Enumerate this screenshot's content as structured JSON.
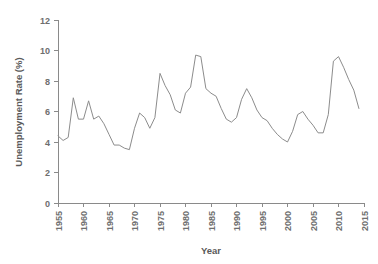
{
  "chart_data": {
    "type": "line",
    "title": "",
    "xlabel": "Year",
    "ylabel": "Unemployment Rate (%)",
    "xlim": [
      1955,
      2015
    ],
    "ylim": [
      0,
      12
    ],
    "xticks": [
      1955,
      1960,
      1965,
      1970,
      1975,
      1980,
      1985,
      1990,
      1995,
      2000,
      2005,
      2010,
      2015
    ],
    "yticks": [
      0,
      2,
      4,
      6,
      8,
      10,
      12
    ],
    "grid": false,
    "legend": "none",
    "line_color": "#8c8c8c",
    "series": [
      {
        "name": "Unemployment Rate",
        "x": [
          1955,
          1956,
          1957,
          1958,
          1959,
          1960,
          1961,
          1962,
          1963,
          1964,
          1965,
          1966,
          1967,
          1968,
          1969,
          1970,
          1971,
          1972,
          1973,
          1974,
          1975,
          1976,
          1977,
          1978,
          1979,
          1980,
          1981,
          1982,
          1983,
          1984,
          1985,
          1986,
          1987,
          1988,
          1989,
          1990,
          1991,
          1992,
          1993,
          1994,
          1995,
          1996,
          1997,
          1998,
          1999,
          2000,
          2001,
          2002,
          2003,
          2004,
          2005,
          2006,
          2007,
          2008,
          2009,
          2010,
          2011,
          2012,
          2013,
          2014
        ],
        "values": [
          4.4,
          4.1,
          4.3,
          6.9,
          5.5,
          5.5,
          6.7,
          5.5,
          5.7,
          5.2,
          4.5,
          3.8,
          3.8,
          3.6,
          3.5,
          4.9,
          5.9,
          5.6,
          4.9,
          5.6,
          8.5,
          7.7,
          7.1,
          6.1,
          5.9,
          7.2,
          7.6,
          9.7,
          9.6,
          7.5,
          7.2,
          7.0,
          6.2,
          5.5,
          5.3,
          5.6,
          6.8,
          7.5,
          6.9,
          6.1,
          5.6,
          5.4,
          4.9,
          4.5,
          4.2,
          4.0,
          4.7,
          5.8,
          6.0,
          5.5,
          5.1,
          4.6,
          4.6,
          5.8,
          9.3,
          9.6,
          8.9,
          8.1,
          7.4,
          6.2
        ]
      }
    ]
  },
  "accessibility": {
    "figure_label": "Line chart of unemployment rate by year"
  }
}
